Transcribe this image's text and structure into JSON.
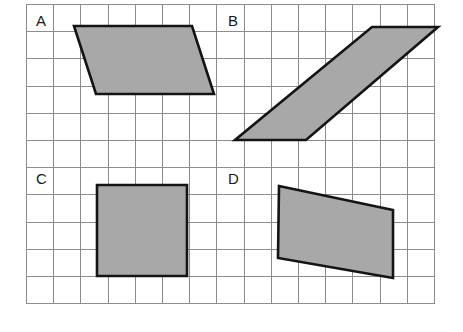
{
  "figure": {
    "background_color": "#ffffff",
    "grid": {
      "x0": 26,
      "y0": 4,
      "cell": 27.2,
      "cols": 15,
      "rows": 11,
      "line_color": "#8d8d8d",
      "visible": true
    },
    "style": {
      "fill_color": "#a8a8a8",
      "stroke_color": "#141414",
      "stroke_width": 2.6,
      "label_color": "#1a1a1a",
      "label_font_size": 15
    },
    "shapes": [
      {
        "label": "A",
        "kind": "parallelogram",
        "label_pos": {
          "x": 36,
          "y": 26
        },
        "points": "74,26 192,26 214,94 96,94",
        "vertices": [
          {
            "x": 74,
            "y": 26
          },
          {
            "x": 192,
            "y": 26
          },
          {
            "x": 214,
            "y": 94
          },
          {
            "x": 96,
            "y": 94
          }
        ]
      },
      {
        "label": "B",
        "kind": "parallelogram",
        "label_pos": {
          "x": 228,
          "y": 26
        },
        "points": "372,27 438,27 306,140 235,140",
        "vertices": [
          {
            "x": 372,
            "y": 27
          },
          {
            "x": 438,
            "y": 27
          },
          {
            "x": 306,
            "y": 140
          },
          {
            "x": 235,
            "y": 140
          }
        ]
      },
      {
        "label": "C",
        "kind": "square",
        "label_pos": {
          "x": 36,
          "y": 184
        },
        "points": "97,185 187,185 187,276 97,276",
        "vertices": [
          {
            "x": 97,
            "y": 185
          },
          {
            "x": 187,
            "y": 185
          },
          {
            "x": 187,
            "y": 276
          },
          {
            "x": 97,
            "y": 276
          }
        ]
      },
      {
        "label": "D",
        "kind": "trapezoid",
        "label_pos": {
          "x": 228,
          "y": 184
        },
        "points": "279,186 393,210 393,278 278,258",
        "vertices": [
          {
            "x": 279,
            "y": 186
          },
          {
            "x": 393,
            "y": 210
          },
          {
            "x": 393,
            "y": 278
          },
          {
            "x": 278,
            "y": 258
          }
        ]
      }
    ]
  }
}
